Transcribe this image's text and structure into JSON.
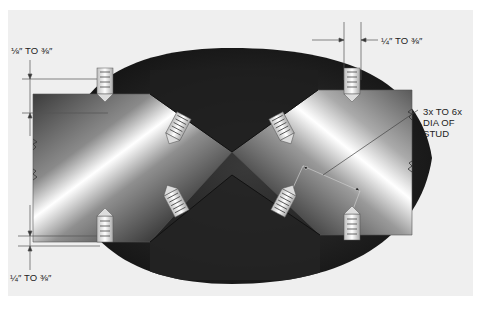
{
  "figure": {
    "background_color": "#efefef",
    "weld_color": "#1a1a1a",
    "plate_highlight": "#ffffff"
  },
  "labels": {
    "top_left_spacing": "⅛″ TO ⅜″",
    "top_right_spacing": "¼″ TO ⅜″",
    "bottom_left_spacing": "¼″ TO ⅜″",
    "stud_spacing_line1": "3x TO 6x",
    "stud_spacing_line2": "DIA OF",
    "stud_spacing_line3": "STUD"
  },
  "studs": [
    {
      "name": "top-left-vertical",
      "x": 105,
      "y": 80,
      "angle": 0,
      "point": "down"
    },
    {
      "name": "upper-left-angled",
      "x": 178,
      "y": 127,
      "angle": 28,
      "point": "down"
    },
    {
      "name": "upper-right-angled",
      "x": 282,
      "y": 127,
      "angle": -28,
      "point": "down"
    },
    {
      "name": "top-right-vertical",
      "x": 352,
      "y": 80,
      "angle": 0,
      "point": "down"
    },
    {
      "name": "bottom-left-vertical",
      "x": 105,
      "y": 230,
      "angle": 0,
      "point": "up"
    },
    {
      "name": "lower-left-angled",
      "x": 176,
      "y": 202,
      "angle": -28,
      "point": "up"
    },
    {
      "name": "lower-right-angled",
      "x": 284,
      "y": 202,
      "angle": 28,
      "point": "up"
    },
    {
      "name": "bottom-right-vertical",
      "x": 352,
      "y": 228,
      "angle": 0,
      "point": "up"
    }
  ]
}
